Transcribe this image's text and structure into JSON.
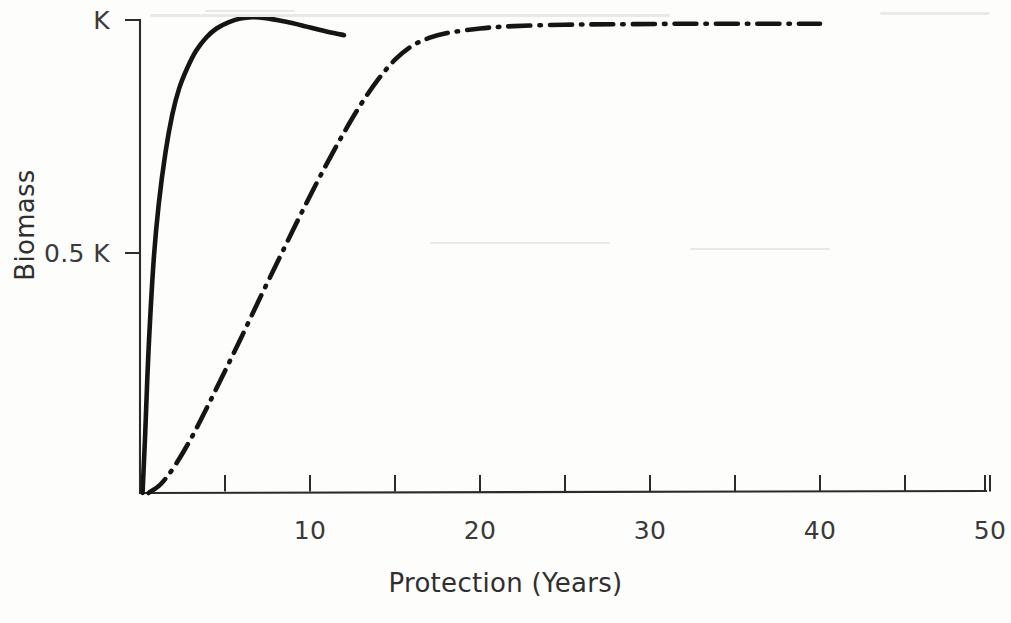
{
  "chart_data": {
    "type": "line",
    "title": "",
    "xlabel": "Protection (Years)",
    "ylabel": "Biomass",
    "xlim": [
      0,
      50
    ],
    "ylim": [
      0,
      1.06
    ],
    "grid": false,
    "legend": "none",
    "x_ticks": [
      0,
      5,
      10,
      15,
      20,
      25,
      30,
      35,
      40,
      45,
      50
    ],
    "x_tick_labels": [
      "",
      "",
      "10",
      "",
      "20",
      "",
      "30",
      "",
      "40",
      "",
      "50"
    ],
    "y_ticks": [
      0.5,
      1.0
    ],
    "y_tick_labels": [
      "0.5 K",
      "K"
    ],
    "series": [
      {
        "name": "fast-recovery-solid",
        "style": "solid",
        "color": "#151515",
        "x": [
          0.15,
          0.3,
          0.5,
          0.8,
          1.1,
          1.5,
          1.9,
          2.3,
          2.8,
          3.3,
          3.9,
          4.5,
          5.2,
          5.9,
          6.6,
          7.4,
          8.2,
          9.0,
          9.8,
          10.6,
          11.3,
          12.0
        ],
        "y": [
          0.0,
          0.12,
          0.3,
          0.49,
          0.61,
          0.72,
          0.8,
          0.855,
          0.9,
          0.935,
          0.963,
          0.982,
          0.995,
          1.003,
          1.006,
          1.004,
          0.999,
          0.993,
          0.986,
          0.979,
          0.973,
          0.968
        ]
      },
      {
        "name": "slow-recovery-dashdot",
        "style": "dash-dot",
        "color": "#151515",
        "x": [
          0.5,
          1.2,
          2.0,
          3.0,
          4.0,
          5.0,
          6.0,
          7.0,
          8.0,
          9.0,
          10.0,
          11.0,
          12.0,
          13.0,
          14.0,
          15.0,
          16.0,
          17.0,
          18.0,
          20.0,
          22.0,
          25.0,
          28.0,
          32.0,
          36.0,
          40.0
        ],
        "y": [
          0.0,
          0.018,
          0.055,
          0.115,
          0.185,
          0.258,
          0.332,
          0.408,
          0.482,
          0.556,
          0.628,
          0.697,
          0.762,
          0.822,
          0.874,
          0.916,
          0.945,
          0.962,
          0.972,
          0.982,
          0.987,
          0.99,
          0.991,
          0.992,
          0.992,
          0.992
        ]
      }
    ]
  },
  "axes": {
    "x_title": "Protection (Years)",
    "y_title": "Biomass",
    "y_top_label": "K",
    "y_mid_label": "0.5 K",
    "x_labels": [
      "10",
      "20",
      "30",
      "40",
      "50"
    ]
  }
}
